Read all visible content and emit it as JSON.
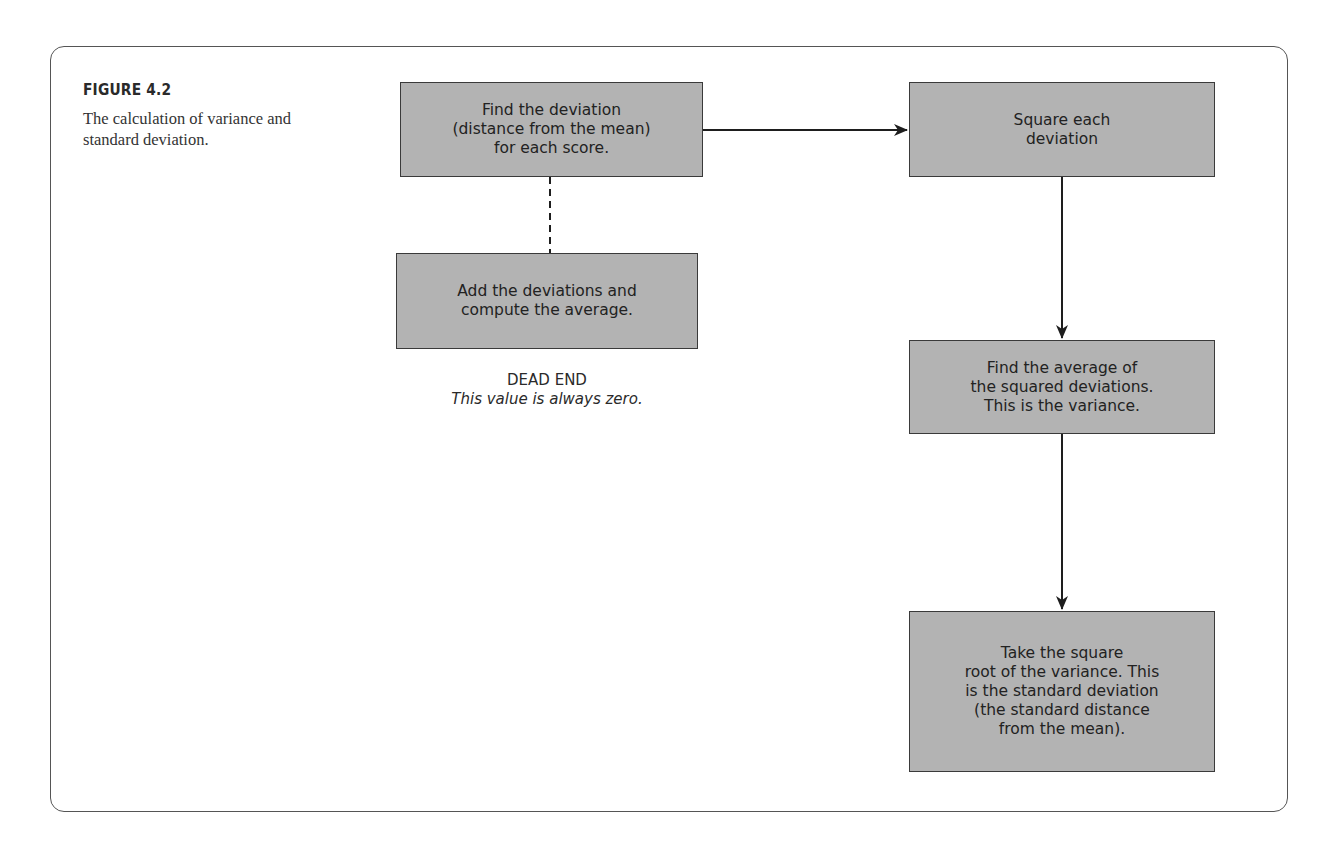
{
  "figure": {
    "label": "FIGURE 4.2",
    "caption": "The calculation of variance and standard deviation."
  },
  "flowchart": {
    "steps": [
      {
        "id": "find-deviation",
        "text": "Find the deviation\n(distance from the mean)\nfor each score."
      },
      {
        "id": "square-deviation",
        "text": "Square each\ndeviation"
      },
      {
        "id": "average-squared",
        "text": "Find the average of\nthe squared deviations.\nThis is the variance."
      },
      {
        "id": "square-root",
        "text": "Take the square\nroot of the variance. This\nis the standard deviation\n(the standard distance\nfrom the mean)."
      },
      {
        "id": "add-deviations",
        "text": "Add the deviations and\ncompute the average."
      }
    ],
    "dead_end": {
      "title": "DEAD END",
      "note": "This value is always zero."
    },
    "connections": [
      {
        "from": "find-deviation",
        "to": "square-deviation",
        "style": "solid-arrow"
      },
      {
        "from": "square-deviation",
        "to": "average-squared",
        "style": "solid-arrow"
      },
      {
        "from": "average-squared",
        "to": "square-root",
        "style": "solid-arrow"
      },
      {
        "from": "find-deviation",
        "to": "add-deviations",
        "style": "dashed-line"
      }
    ]
  },
  "colors": {
    "box_fill": "#b3b3b3",
    "box_border": "#3a3a3a",
    "frame_border": "#555555",
    "text": "#222222"
  }
}
